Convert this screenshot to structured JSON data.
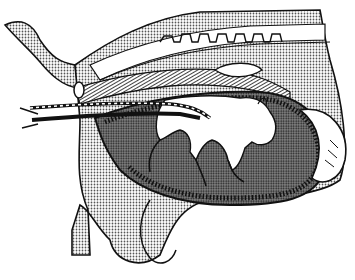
{
  "figure": {
    "type": "anatomical-illustration",
    "style": "black-and-white stippled line drawing",
    "labels": [],
    "colors": {
      "background": "#ffffff",
      "ink": "#111111",
      "stipple_light": "#c8c8c8",
      "stipple_dark": "#6e6e6e",
      "fetus": "#ffffff"
    }
  }
}
